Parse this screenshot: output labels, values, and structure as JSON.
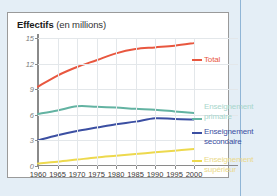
{
  "figure": {
    "title_strong": "Effectifs",
    "title_light": " (en millions)"
  },
  "colors": {
    "total": "#e8573f",
    "primaire": "#63b3a2",
    "secondaire": "#3b4fa2",
    "superieur": "#edd94e",
    "primaire_label": "#a8d6cc",
    "superieur_label": "#ead98a",
    "grid": "#e3e7ea",
    "axis": "#8a8a8a",
    "card_bg": "#ffffff",
    "page_bg": "#e4eef6",
    "rule": "#8fb5d6"
  },
  "legend": {
    "total": "Total",
    "primaire_line1": "Enseignement",
    "primaire_line2": "primaire",
    "secondaire_line1": "Enseignement",
    "secondaire_line2": "secondaire",
    "superieur_line1": "Enseignement",
    "superieur_line2": "supérieur"
  },
  "chart_data": {
    "type": "line",
    "title": "Effectifs (en millions)",
    "xlabel": "",
    "ylabel": "",
    "xlim": [
      1960,
      2000
    ],
    "ylim": [
      0,
      15
    ],
    "yticks": [
      0,
      3,
      6,
      9,
      12,
      15
    ],
    "ytick_labels": [
      "0",
      "3",
      "6",
      "9",
      "12",
      "15"
    ],
    "x": [
      1960,
      1965,
      1970,
      1975,
      1980,
      1985,
      1990,
      1995,
      2000
    ],
    "xtick_labels": [
      "1960",
      "1965",
      "1970",
      "1975",
      "1980",
      "1985",
      "1990",
      "1995",
      "2000"
    ],
    "grid": true,
    "legend_position": "right",
    "series": [
      {
        "name": "Total",
        "color": "#e8573f",
        "values": [
          9.3,
          10.6,
          11.6,
          12.4,
          13.2,
          13.7,
          13.9,
          14.1,
          14.4
        ]
      },
      {
        "name": "Enseignement primaire",
        "color": "#63b3a2",
        "values": [
          6.1,
          6.5,
          7.0,
          6.95,
          6.85,
          6.7,
          6.6,
          6.4,
          6.2
        ]
      },
      {
        "name": "Enseignement secondaire",
        "color": "#3b4fa2",
        "values": [
          3.0,
          3.6,
          4.1,
          4.5,
          4.9,
          5.2,
          5.6,
          5.5,
          5.45
        ]
      },
      {
        "name": "Enseignement supérieur",
        "color": "#edd94e",
        "values": [
          0.3,
          0.5,
          0.75,
          1.0,
          1.2,
          1.4,
          1.6,
          1.8,
          2.0
        ]
      }
    ]
  }
}
